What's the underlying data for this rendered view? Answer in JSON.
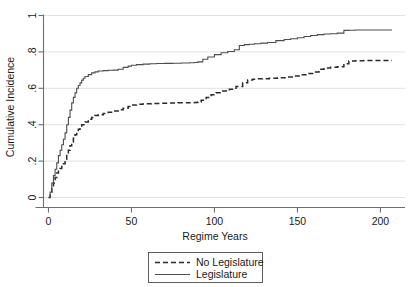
{
  "chart_data": {
    "type": "line",
    "title": "",
    "xlabel": "Regime Years",
    "ylabel": "Cumulative Incidence",
    "xlim": [
      -3,
      210
    ],
    "ylim": [
      -0.02,
      1.0
    ],
    "grid": true,
    "grid_axis": "y",
    "legend_position": "below-center",
    "step_style": "post",
    "xticks": [
      0,
      50,
      100,
      150,
      200
    ],
    "xtick_labels": [
      "0",
      "50",
      "100",
      "150",
      "200"
    ],
    "yticks": [
      0,
      0.2,
      0.4,
      0.6,
      0.8,
      1
    ],
    "ytick_labels": [
      "0",
      ".2",
      ".4",
      ".6",
      ".8",
      "1"
    ],
    "series": [
      {
        "name": "No Legislature",
        "style": "dashed",
        "color": "#2b2b2b",
        "x": [
          0,
          1,
          2,
          3,
          4,
          5,
          6,
          7,
          8,
          9,
          10,
          11,
          12,
          13,
          14,
          15,
          16,
          17,
          18,
          19,
          20,
          22,
          24,
          26,
          28,
          30,
          33,
          36,
          39,
          42,
          45,
          48,
          50,
          53,
          57,
          62,
          67,
          72,
          78,
          84,
          88,
          90,
          92,
          95,
          98,
          101,
          105,
          109,
          113,
          117,
          120,
          123,
          126,
          129,
          133,
          138,
          143,
          148,
          152,
          156,
          160,
          163,
          166,
          170,
          174,
          178,
          181,
          185,
          190,
          196,
          202,
          207
        ],
        "y": [
          0,
          0.02,
          0.05,
          0.08,
          0.11,
          0.135,
          0.15,
          0.16,
          0.17,
          0.185,
          0.21,
          0.235,
          0.26,
          0.285,
          0.305,
          0.325,
          0.345,
          0.36,
          0.375,
          0.385,
          0.4,
          0.415,
          0.43,
          0.44,
          0.45,
          0.455,
          0.462,
          0.468,
          0.475,
          0.482,
          0.49,
          0.5,
          0.508,
          0.512,
          0.515,
          0.517,
          0.518,
          0.519,
          0.52,
          0.521,
          0.522,
          0.525,
          0.535,
          0.55,
          0.565,
          0.575,
          0.585,
          0.595,
          0.61,
          0.63,
          0.645,
          0.65,
          0.652,
          0.653,
          0.655,
          0.658,
          0.662,
          0.668,
          0.675,
          0.682,
          0.69,
          0.705,
          0.712,
          0.715,
          0.718,
          0.735,
          0.75,
          0.752,
          0.753,
          0.753,
          0.753,
          0.753
        ]
      },
      {
        "name": "Legislature",
        "style": "solid",
        "color": "#4d4d4d",
        "x": [
          0,
          1,
          2,
          3,
          4,
          5,
          6,
          7,
          8,
          9,
          10,
          11,
          12,
          13,
          14,
          15,
          16,
          17,
          18,
          19,
          20,
          21,
          22,
          24,
          26,
          28,
          30,
          33,
          36,
          39,
          42,
          45,
          48,
          50,
          53,
          57,
          61,
          65,
          70,
          75,
          80,
          85,
          88,
          90,
          93,
          96,
          100,
          104,
          108,
          112,
          115,
          118,
          121,
          124,
          128,
          132,
          137,
          142,
          146,
          150,
          154,
          158,
          162,
          166,
          170,
          174,
          178,
          181,
          185,
          190,
          196,
          202,
          207
        ],
        "y": [
          0,
          0.03,
          0.08,
          0.12,
          0.155,
          0.19,
          0.23,
          0.26,
          0.29,
          0.32,
          0.355,
          0.4,
          0.44,
          0.48,
          0.52,
          0.55,
          0.575,
          0.6,
          0.615,
          0.63,
          0.645,
          0.655,
          0.665,
          0.675,
          0.685,
          0.69,
          0.695,
          0.697,
          0.699,
          0.7,
          0.705,
          0.715,
          0.722,
          0.727,
          0.73,
          0.733,
          0.735,
          0.736,
          0.737,
          0.738,
          0.739,
          0.74,
          0.742,
          0.745,
          0.76,
          0.772,
          0.785,
          0.795,
          0.802,
          0.812,
          0.835,
          0.84,
          0.842,
          0.845,
          0.848,
          0.852,
          0.862,
          0.868,
          0.872,
          0.878,
          0.885,
          0.89,
          0.895,
          0.898,
          0.9,
          0.903,
          0.918,
          0.919,
          0.92,
          0.92,
          0.92,
          0.92,
          0.92
        ]
      }
    ]
  },
  "legend": {
    "items": [
      {
        "label": "No Legislature",
        "style": "dashed"
      },
      {
        "label": "Legislature",
        "style": "solid"
      }
    ]
  },
  "axes": {
    "x_title": "Regime Years",
    "y_title": "Cumulative Incidence"
  }
}
